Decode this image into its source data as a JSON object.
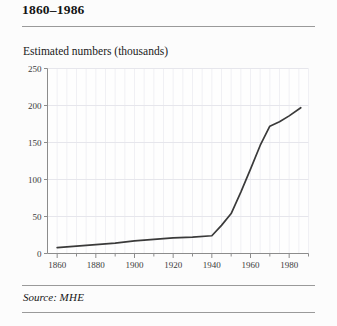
{
  "figure": {
    "title": "1860–1986",
    "axis_caption": "Estimated numbers (thousands)",
    "source_label": "Source:",
    "source_value": "MHE"
  },
  "colors": {
    "line": "#3a3a3a",
    "axis": "#8c8c8c",
    "gridline": "#e6e6ec",
    "rule": "#9a9a9a",
    "background": "#fcfcfc",
    "text": "#1a1a1a"
  },
  "chart_data": {
    "type": "line",
    "title": "1860–1986",
    "subtitle": "",
    "xlabel": "",
    "ylabel": "Estimated numbers (thousands)",
    "xlim": [
      1855,
      1990
    ],
    "ylim": [
      0,
      250
    ],
    "grid": true,
    "legend": null,
    "y_ticks": [
      0,
      50,
      100,
      150,
      200,
      250
    ],
    "y_tick_labels": [
      "0",
      "50",
      "100",
      "150",
      "200",
      "250"
    ],
    "x_ticks": [
      1860,
      1880,
      1900,
      1920,
      1940,
      1960,
      1980
    ],
    "x_tick_labels": [
      "1860",
      "1880",
      "1900",
      "1920",
      "1940",
      "1960",
      "1980"
    ],
    "x_minor_ticks": [
      1870,
      1890,
      1910,
      1930,
      1950,
      1970,
      1990
    ],
    "series": [
      {
        "name": "Estimated numbers",
        "x": [
          1860,
          1870,
          1880,
          1890,
          1900,
          1910,
          1920,
          1930,
          1940,
          1945,
          1950,
          1955,
          1960,
          1965,
          1970,
          1975,
          1980,
          1986
        ],
        "values": [
          8,
          10,
          12,
          14,
          17,
          19,
          21,
          22,
          24,
          38,
          54,
          83,
          114,
          146,
          172,
          178,
          186,
          197
        ]
      }
    ]
  }
}
